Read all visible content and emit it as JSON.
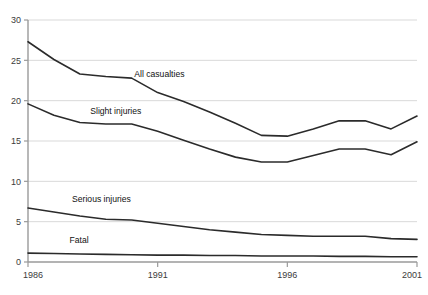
{
  "chart_data": {
    "type": "line",
    "title": "",
    "subtitle": "",
    "xlabel": "",
    "ylabel": "",
    "xlim": [
      1986,
      2001
    ],
    "ylim": [
      0,
      30
    ],
    "x": [
      1986,
      1987,
      1988,
      1989,
      1990,
      1991,
      1992,
      1993,
      1994,
      1995,
      1996,
      1997,
      1998,
      1999,
      2000,
      2001
    ],
    "xticks": [
      1986,
      1991,
      1996,
      2001
    ],
    "xtick_labels": [
      "1986",
      "1991",
      "1996",
      "2001"
    ],
    "yticks": [
      0,
      5,
      10,
      15,
      20,
      25,
      30
    ],
    "ytick_labels": [
      "0",
      "5",
      "10",
      "15",
      "20",
      "25",
      "30"
    ],
    "grid": "horizontal",
    "legend_position": "inline-annotations",
    "series": [
      {
        "name": "All casualties",
        "label_x": 1990.1,
        "label_y": 22.9,
        "values": [
          27.3,
          25.1,
          23.3,
          23.0,
          22.8,
          21.0,
          19.9,
          18.6,
          17.2,
          15.7,
          15.6,
          16.5,
          17.5,
          17.5,
          16.5,
          18.1
        ]
      },
      {
        "name": "Slight injuries",
        "label_x": 1988.4,
        "label_y": 18.4,
        "values": [
          19.6,
          18.2,
          17.3,
          17.1,
          17.1,
          16.2,
          15.1,
          14.0,
          13.0,
          12.4,
          12.4,
          13.2,
          14.0,
          14.0,
          13.3,
          14.9
        ]
      },
      {
        "name": "Serious injuries",
        "label_x": 1987.7,
        "label_y": 7.4,
        "values": [
          6.7,
          6.2,
          5.7,
          5.3,
          5.2,
          4.8,
          4.4,
          4.0,
          3.7,
          3.4,
          3.3,
          3.2,
          3.2,
          3.2,
          2.9,
          2.8
        ]
      },
      {
        "name": "Fatal",
        "label_x": 1987.6,
        "label_y": 2.3,
        "values": [
          1.1,
          1.05,
          1.0,
          0.95,
          0.9,
          0.85,
          0.85,
          0.8,
          0.8,
          0.75,
          0.75,
          0.75,
          0.7,
          0.7,
          0.65,
          0.65
        ]
      }
    ],
    "colors": {
      "line": "#2b2b2b",
      "grid": "#d9d9d9",
      "axis": "#9a9a9a",
      "tick_text": "#3b3b3b",
      "label_text": "#111111",
      "background": "#ffffff"
    }
  }
}
